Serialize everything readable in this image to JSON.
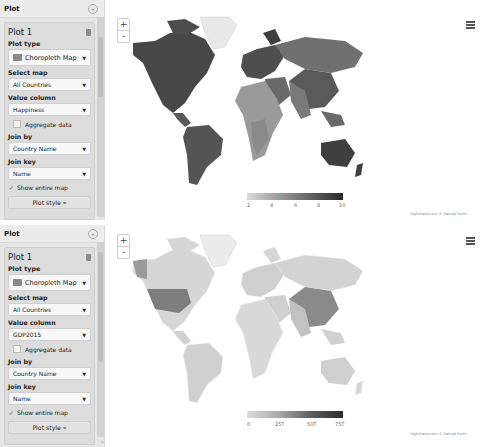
{
  "plots": [
    {
      "panel_title": "Plot",
      "card_title": "Plot 1",
      "plot_type_label": "Plot type",
      "plot_type_value": "Choropleth Map",
      "select_map_label": "Select map",
      "select_map_value": "All Countries",
      "value_column_label": "Value column",
      "value_column_value": "Happiness",
      "aggregate_label": "Aggregate data",
      "aggregate_checked": false,
      "join_by_label": "Join by",
      "join_by_value": "Country Name",
      "join_key_label": "Join key",
      "join_key_value": "Name",
      "show_entire_map_label": "Show entire map",
      "show_entire_map_checked": true,
      "plot_style_label": "Plot style »",
      "zoom_in": "+",
      "zoom_out": "-",
      "legend_ticks": [
        "2",
        "4",
        "6",
        "8",
        "10"
      ],
      "credits": "Highcharts.com © Natural Earth"
    },
    {
      "panel_title": "Plot",
      "card_title": "Plot 1",
      "plot_type_label": "Plot type",
      "plot_type_value": "Choropleth Map",
      "select_map_label": "Select map",
      "select_map_value": "All Countries",
      "value_column_label": "Value column",
      "value_column_value": "GDP2015",
      "aggregate_label": "Aggregate data",
      "aggregate_checked": false,
      "join_by_label": "Join by",
      "join_by_value": "Country Name",
      "join_key_label": "Join key",
      "join_key_value": "Name",
      "show_entire_map_label": "Show entire map",
      "show_entire_map_checked": true,
      "plot_style_label": "Plot style »",
      "zoom_in": "+",
      "zoom_out": "-",
      "legend_ticks": [
        "0",
        "25T",
        "50T",
        "75T"
      ],
      "credits": "Highcharts.com © Natural Earth"
    }
  ],
  "icons": {
    "collapse": "«",
    "caret": "▼",
    "check": "✓",
    "scroll_down": "⌄"
  },
  "colors": {
    "panel_bg": "#e6e6e6",
    "map_dark": "#4a4a4a",
    "map_mid": "#7d7d7d",
    "map_light": "#d9d9d9"
  }
}
